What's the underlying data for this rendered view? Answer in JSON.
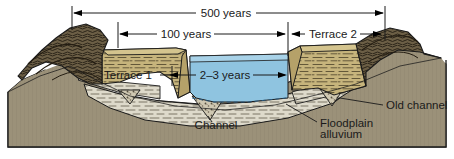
{
  "figure": {
    "name": "river-terrace-block-diagram",
    "width": 454,
    "height": 159
  },
  "dimension_labels": {
    "total_span": "500 years",
    "terrace1_span": "100 years",
    "terrace2_span": "Terrace 2",
    "channel_span": "2–3 years"
  },
  "feature_labels": {
    "terrace1": "Terrace 1",
    "channel": "Channel",
    "floodplain_line1": "Floodplain",
    "floodplain_line2": "alluvium",
    "old_channel": "Old channel"
  },
  "colors": {
    "water": "#8FC4E0",
    "water_dark": "#5FA8D0",
    "terrace_fill": "#C6B47C",
    "terrace_dark": "#B5A169",
    "alluvium": "#DEDACB",
    "bedrock": "#9B9179",
    "bedrock_dark": "#8A8069",
    "hill_dark": "#4A4030",
    "hill_mid": "#6B5E45",
    "outline": "#1a1a1a",
    "background": "#ffffff"
  },
  "icon_names": {
    "arrow_left": "arrow-left-icon",
    "arrow_right": "arrow-right-icon",
    "tick": "tick-mark-icon"
  }
}
